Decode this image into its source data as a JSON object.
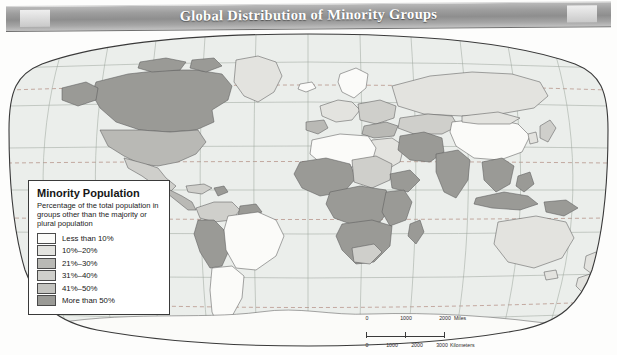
{
  "banner": {
    "title": "Global Distribution of Minority Groups"
  },
  "legend": {
    "title": "Minority Population",
    "subtitle": "Percentage of the total population in groups other than the majority or plural population",
    "classes": [
      {
        "label": "Less than 10%",
        "color": "#fbfbf9"
      },
      {
        "label": "10%–20%",
        "color": "#e3e3df"
      },
      {
        "label": "21%–30%",
        "color": "#b9b9b5"
      },
      {
        "label": "31%–40%",
        "color": "#cfcfcb"
      },
      {
        "label": "41%–50%",
        "color": "#c4c4c0"
      },
      {
        "label": "More than 50%",
        "color": "#9a9a96"
      }
    ]
  },
  "scalebar": {
    "miles": {
      "ticks": [
        "0",
        "1000",
        "2000"
      ],
      "unit": "Miles"
    },
    "kilometers": {
      "ticks": [
        "0",
        "1000",
        "2000",
        "3000"
      ],
      "unit": "Kilometers"
    }
  },
  "map": {
    "projection": "robinson",
    "ocean_color": "#eceeec",
    "graticule_color": "#9aa39a",
    "tropic_line_color": "#b08a7e",
    "border_color": "#3a3a3a",
    "country_border_color": "#5c5c5c",
    "regions": [
      {
        "name": "canada",
        "class": "More than 50%"
      },
      {
        "name": "united-states",
        "class": "21%–30%"
      },
      {
        "name": "mexico",
        "class": "31%–40%"
      },
      {
        "name": "central-america",
        "class": "21%–30%"
      },
      {
        "name": "brazil",
        "class": "Less than 10%"
      },
      {
        "name": "peru-bolivia",
        "class": "More than 50%"
      },
      {
        "name": "argentina",
        "class": "Less than 10%"
      },
      {
        "name": "west-africa",
        "class": "More than 50%"
      },
      {
        "name": "central-africa",
        "class": "More than 50%"
      },
      {
        "name": "east-africa",
        "class": "More than 50%"
      },
      {
        "name": "southern-africa",
        "class": "More than 50%"
      },
      {
        "name": "north-africa",
        "class": "Less than 10%"
      },
      {
        "name": "russia",
        "class": "10%–20%"
      },
      {
        "name": "china",
        "class": "Less than 10%"
      },
      {
        "name": "india",
        "class": "More than 50%"
      },
      {
        "name": "iran-afghanistan",
        "class": "More than 50%"
      },
      {
        "name": "indonesia",
        "class": "More than 50%"
      },
      {
        "name": "papua-new-guinea",
        "class": "More than 50%"
      },
      {
        "name": "australia",
        "class": "Less than 10%"
      },
      {
        "name": "antarctica",
        "class": "Less than 10%"
      }
    ]
  }
}
